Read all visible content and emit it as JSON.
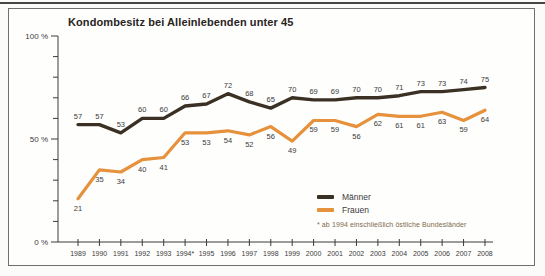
{
  "page": {
    "title": "Kondombesitz bei Alleinlebenden unter 45"
  },
  "chart_data": {
    "type": "line",
    "title": "Kondombesitz bei Alleinlebenden unter 45",
    "categories": [
      "1989",
      "1990",
      "1991",
      "1992",
      "1993",
      "1994*",
      "1995",
      "1996",
      "1997",
      "1998",
      "1999",
      "2000",
      "2001",
      "2002",
      "2003",
      "2004",
      "2005",
      "2006",
      "2007",
      "2008"
    ],
    "series": [
      {
        "name": "Männer",
        "color": "#3a3124",
        "values": [
          57,
          57,
          53,
          60,
          60,
          66,
          67,
          72,
          68,
          65,
          70,
          69,
          69,
          70,
          70,
          71,
          73,
          73,
          74,
          75
        ]
      },
      {
        "name": "Frauen",
        "color": "#e6913c",
        "values": [
          21,
          35,
          34,
          40,
          41,
          53,
          53,
          54,
          52,
          56,
          49,
          59,
          59,
          56,
          62,
          61,
          61,
          63,
          59,
          64
        ]
      }
    ],
    "ylim": [
      0,
      100
    ],
    "y_ticks": [
      {
        "value": 0,
        "label": "0 %"
      },
      {
        "value": 50,
        "label": "50 %"
      },
      {
        "value": 100,
        "label": "100 %"
      }
    ],
    "y_minor_step": 10,
    "grid": false,
    "legend_position": "bottom-right",
    "annotation": "* ab 1994 einschließlich östliche Bundesländer",
    "value_labels_shown": true,
    "axis_color": "#3b3b3b",
    "label_color": "#3b3b3b"
  }
}
